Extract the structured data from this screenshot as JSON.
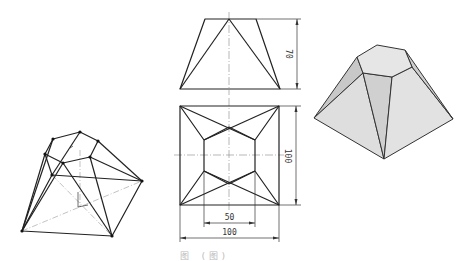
{
  "figure": {
    "views": {
      "wireframe_isometric": {
        "label": "Isometric wireframe view"
      },
      "front_view": {
        "label": "Front view",
        "dimensions": {
          "height": "70"
        }
      },
      "top_view": {
        "label": "Top view",
        "dimensions": {
          "depth": "100",
          "inner_width": "50",
          "outer_width": "100"
        }
      },
      "shaded_solid": {
        "label": "Shaded 3D solid",
        "fill_color": "#dcdcdc",
        "edge_color": "#333333"
      }
    },
    "caption": "图      (图)"
  }
}
